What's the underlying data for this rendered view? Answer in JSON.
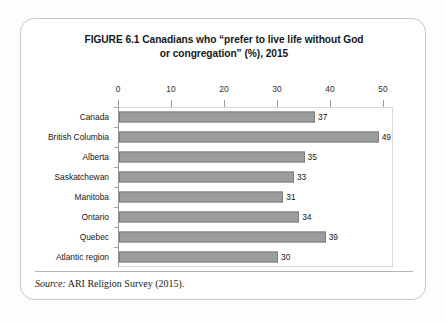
{
  "figure": {
    "title_line1": "FIGURE 6.1  Canadians who “prefer to live life without God",
    "title_line2": "or congregation” (%), 2015",
    "source_label": "Source:",
    "source_text": " ARI Religion Survey (2015)."
  },
  "colors": {
    "bar_fill": "#9b9c9c",
    "bar_border": "#7d7e7e",
    "axis": "#8d8d8d",
    "card_border": "#c9c9c9",
    "text": "#15171a"
  },
  "chart_data": {
    "type": "bar",
    "orientation": "horizontal",
    "title": "FIGURE 6.1  Canadians who “prefer to live life without God or congregation” (%), 2015",
    "xlabel": "",
    "ylabel": "",
    "xlim": [
      0,
      50
    ],
    "xticks": [
      0,
      10,
      20,
      30,
      40,
      50
    ],
    "xtick_labels": [
      "0",
      "10",
      "20",
      "30",
      "40",
      "50"
    ],
    "grid": false,
    "legend": false,
    "data_labels": true,
    "axis_position": "top",
    "categories": [
      "Canada",
      "British Columbia",
      "Alberta",
      "Saskatchewan",
      "Manitoba",
      "Ontario",
      "Quebec",
      "Atlantic region"
    ],
    "values": [
      37,
      49,
      35,
      33,
      31,
      34,
      39,
      30
    ],
    "value_labels": [
      "37",
      "49",
      "35",
      "33",
      "31",
      "34",
      "39",
      "30"
    ],
    "source": "Source: ARI Religion Survey (2015)."
  }
}
